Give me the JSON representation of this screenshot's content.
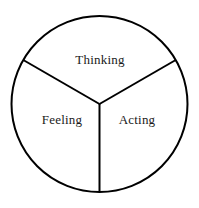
{
  "diagram": {
    "type": "pie-sector-diagram",
    "shape": "circle-divided-in-three",
    "background_color": "#ffffff",
    "stroke_color": "#000000",
    "stroke_width": 2,
    "circle": {
      "center_x": 99.5,
      "center_y": 104,
      "radius": 88
    },
    "divider_angles_deg": [
      90,
      210,
      330
    ],
    "sectors": [
      {
        "id": "thinking",
        "label": "Thinking",
        "position": "top",
        "label_x": 100,
        "label_y": 59,
        "start_angle_deg": 210,
        "end_angle_deg": 330
      },
      {
        "id": "feeling",
        "label": "Feeling",
        "position": "bottom-left",
        "label_x": 62,
        "label_y": 119,
        "start_angle_deg": 90,
        "end_angle_deg": 210
      },
      {
        "id": "acting",
        "label": "Acting",
        "position": "bottom-right",
        "label_x": 137,
        "label_y": 119,
        "start_angle_deg": 330,
        "end_angle_deg": 90
      }
    ]
  }
}
